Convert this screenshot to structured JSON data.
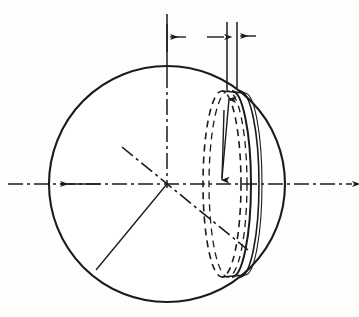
{
  "figure": {
    "background_color": "#fdfdfc",
    "ink_color": "#1b1b1b"
  },
  "labels": {
    "y_axis": "y",
    "x_axis": "x",
    "x_dimension": "x",
    "dx_dimension": "dx",
    "disc_radius": "y",
    "sphere_radius": "r"
  },
  "geometry": {
    "sphere": {
      "center_x": 167,
      "center_y": 184,
      "radius": 118,
      "outline_color": "#1b1b1b",
      "outline_width": 2.1,
      "stipple_color": "#222222"
    },
    "slice": {
      "front_face_center_x": 232,
      "back_face_center_x": 222,
      "ellipse_rx": 19,
      "ellipse_ry": 93,
      "thickness_px": 10,
      "dashed_face_color": "#1b1b1b",
      "solid_face_color": "#1b1b1b"
    },
    "axes": {
      "x_axis_y": 184,
      "x_axis_left_end": 8,
      "x_axis_right_end": 352,
      "y_axis_x": 167,
      "y_axis_top_end": 14,
      "dash_dot_pattern": "14 4 3 4"
    },
    "dimension_line": {
      "y_position": 37,
      "left_tick_x": 167,
      "x_arrow_right_x": 227,
      "dx_left_x": 227,
      "dx_right_x": 237,
      "dx_label_x": 262
    },
    "disc_radius_arrow": {
      "top_x": 231,
      "top_y": 95,
      "bottom_x": 222,
      "bottom_y": 180
    },
    "radius_line": {
      "from_x": 167,
      "from_y": 184,
      "to_x": 96,
      "to_y": 270
    }
  },
  "label_positions": {
    "y_axis": {
      "x": 160,
      "y": 22
    },
    "x_dimension": {
      "x": 193,
      "y": 42
    },
    "dx_dimension": {
      "x": 278,
      "y": 40
    },
    "x_axis": {
      "x": 345,
      "y": 170
    },
    "disc_radius": {
      "x": 231,
      "y": 138
    },
    "sphere_radius": {
      "x": 128,
      "y": 233
    }
  },
  "stipple": {
    "seed": 20240517,
    "left_cap_count": 520,
    "right_rim_count": 330,
    "dot_min_radius": 0.55,
    "dot_max_radius": 1.65
  },
  "hatching": {
    "stroke_count": 26,
    "color": "#3a3a3a",
    "angle_degrees": -48
  }
}
